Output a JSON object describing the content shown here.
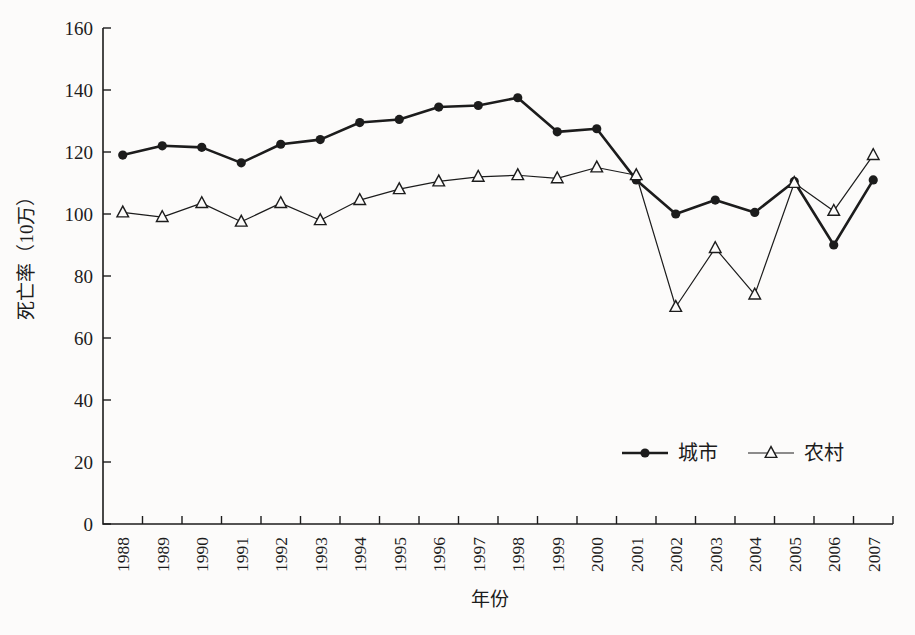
{
  "figure": {
    "background_color": "#fcfbfa",
    "ink_color": "#1c1c1c"
  },
  "chart_data": {
    "type": "line",
    "title": "",
    "xlabel": "年份",
    "ylabel": "死亡率（10万）",
    "ylim": [
      0,
      160
    ],
    "yticks": [
      0,
      20,
      40,
      60,
      80,
      100,
      120,
      140,
      160
    ],
    "grid": false,
    "legend_position": "inside-lower-right",
    "categories": [
      "1988",
      "1989",
      "1990",
      "1991",
      "1992",
      "1993",
      "1994",
      "1995",
      "1996",
      "1997",
      "1998",
      "1999",
      "2000",
      "2001",
      "2002",
      "2003",
      "2004",
      "2005",
      "2006",
      "2007"
    ],
    "series": [
      {
        "key": "urban",
        "name": "城市",
        "marker": "filled-circle",
        "color": "#1c1c1c",
        "line_width": 2.6,
        "values": [
          119,
          122,
          121.5,
          116.5,
          122.5,
          124,
          129.5,
          130.5,
          134.5,
          135,
          137.5,
          126.5,
          127.5,
          111,
          100,
          104.5,
          100.5,
          110.5,
          90,
          111
        ]
      },
      {
        "key": "rural",
        "name": "农村",
        "marker": "open-triangle",
        "color": "#1c1c1c",
        "line_width": 1.2,
        "values": [
          100.5,
          99,
          103.5,
          97.5,
          103.5,
          98,
          104.5,
          108,
          110.5,
          112,
          112.5,
          111.5,
          115,
          112.5,
          70,
          89,
          74,
          110,
          101,
          119
        ]
      }
    ]
  }
}
